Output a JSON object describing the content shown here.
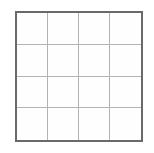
{
  "canvas": {
    "width": 154,
    "height": 153,
    "background_color": "#ffffff"
  },
  "figure": {
    "name": "empty-grid",
    "type": "grid",
    "rows": 4,
    "columns": 4,
    "cell_count": 16,
    "cell_contents": [
      [
        "",
        "",
        "",
        ""
      ],
      [
        "",
        "",
        "",
        ""
      ],
      [
        "",
        "",
        "",
        ""
      ],
      [
        "",
        "",
        "",
        ""
      ]
    ],
    "outer_border_color": "#6a6a6a",
    "outer_border_width_px": 2,
    "inner_line_color": "#b3b3b3",
    "inner_line_width_px": 1,
    "cell_fill_color": "#fefefe",
    "bounds": {
      "left": 15,
      "top": 11,
      "width": 128,
      "height": 131
    }
  }
}
